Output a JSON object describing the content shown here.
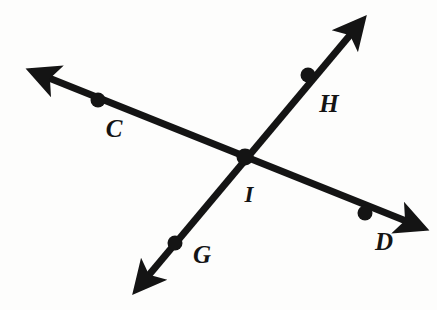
{
  "figure": {
    "type": "geometry-diagram",
    "width": 437,
    "height": 310,
    "background_color": "#fdfdfc",
    "stroke_color": "#141414",
    "stroke_width": 7,
    "dot_radius": 7.5
  },
  "lines": [
    {
      "name": "line-CD",
      "id": "cd",
      "start_arrow": true,
      "end_arrow": true,
      "x1": 34,
      "y1": 72,
      "x2": 421,
      "y2": 227
    },
    {
      "name": "line-GH",
      "id": "gh",
      "start_arrow": true,
      "end_arrow": true,
      "x1": 138,
      "y1": 288,
      "x2": 361,
      "y2": 22
    }
  ],
  "points": [
    {
      "id": "C",
      "label": "C",
      "dot_x": 98,
      "dot_y": 100,
      "label_x": 114,
      "label_y": 128
    },
    {
      "id": "H",
      "label": "H",
      "dot_x": 308,
      "dot_y": 75,
      "label_x": 329,
      "label_y": 103
    },
    {
      "id": "I",
      "label": "I",
      "dot_x": 245,
      "dot_y": 157,
      "label_x": 249,
      "label_y": 194
    },
    {
      "id": "G",
      "label": "G",
      "dot_x": 175,
      "dot_y": 243,
      "label_x": 202,
      "label_y": 254
    },
    {
      "id": "D",
      "label": "D",
      "dot_x": 365,
      "dot_y": 213,
      "label_x": 384,
      "label_y": 241
    }
  ],
  "labels": {
    "C": "C",
    "H": "H",
    "I": "I",
    "G": "G",
    "D": "D"
  }
}
